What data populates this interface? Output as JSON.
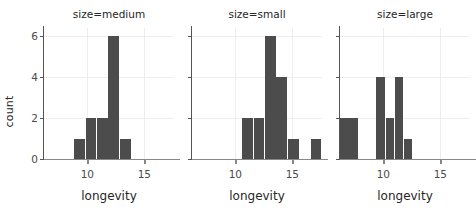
{
  "figure": {
    "ylabel": "count",
    "background": "#ffffff",
    "bar_color": "#4c4c4c",
    "grid_color": "#eceef1"
  },
  "chart_data": {
    "type": "bar",
    "title": "",
    "subtitle": "",
    "xlabel": "longevity",
    "ylabel": "count",
    "xlim": [
      6.2,
      17.6
    ],
    "ylim": [
      0,
      6.4
    ],
    "xticks": [
      10,
      15
    ],
    "xticklabels": [
      "10",
      "15"
    ],
    "yticks": [
      0,
      2,
      4,
      6
    ],
    "yticklabels": [
      "0",
      "2",
      "4",
      "6"
    ],
    "grid": true,
    "legend": "none",
    "facet_variable": "size",
    "shared_y_axis": true,
    "panels": [
      {
        "title": "size=medium",
        "xlabel": "longevity",
        "bins": [
          {
            "left": 8.85,
            "right": 9.85,
            "count": 1
          },
          {
            "left": 9.85,
            "right": 10.85,
            "count": 2
          },
          {
            "left": 10.85,
            "right": 11.85,
            "count": 2
          },
          {
            "left": 11.85,
            "right": 12.85,
            "count": 6
          },
          {
            "left": 12.85,
            "right": 13.85,
            "count": 1
          }
        ],
        "counts": [
          1,
          2,
          2,
          6,
          1
        ]
      },
      {
        "title": "size=small",
        "xlabel": "longevity",
        "bins": [
          {
            "left": 10.6,
            "right": 11.6,
            "count": 2
          },
          {
            "left": 11.6,
            "right": 12.6,
            "count": 2
          },
          {
            "left": 12.6,
            "right": 13.6,
            "count": 6
          },
          {
            "left": 13.6,
            "right": 14.6,
            "count": 4
          },
          {
            "left": 14.6,
            "right": 15.6,
            "count": 1
          },
          {
            "left": 16.6,
            "right": 17.6,
            "count": 1
          }
        ],
        "counts": [
          2,
          2,
          6,
          4,
          1,
          1
        ]
      },
      {
        "title": "size=large",
        "xlabel": "longevity",
        "bins": [
          {
            "left": 6.2,
            "right": 7.0,
            "count": 2
          },
          {
            "left": 7.0,
            "right": 7.8,
            "count": 2
          },
          {
            "left": 9.4,
            "right": 10.2,
            "count": 4
          },
          {
            "left": 10.2,
            "right": 11.0,
            "count": 2
          },
          {
            "left": 11.0,
            "right": 11.8,
            "count": 4
          },
          {
            "left": 11.8,
            "right": 12.6,
            "count": 1
          }
        ],
        "counts": [
          2,
          2,
          4,
          2,
          4,
          1
        ]
      }
    ]
  }
}
